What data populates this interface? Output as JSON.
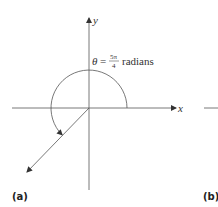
{
  "figure": {
    "axes": {
      "x_label": "x",
      "y_label": "y"
    },
    "angle": {
      "symbol": "θ",
      "equals": "=",
      "numerator": "5π",
      "denominator": "4",
      "unit": "radians",
      "degrees_equivalent": 225
    },
    "panels": [
      {
        "label": "(a)"
      },
      {
        "label": "(b)"
      }
    ],
    "colors": {
      "line": "#555555",
      "background": "#ffffff"
    }
  }
}
